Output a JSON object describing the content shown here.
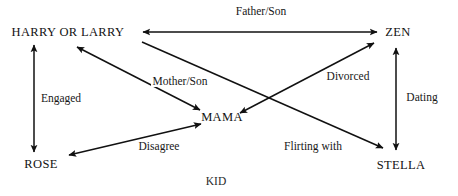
{
  "diagram": {
    "type": "relationship-graph",
    "background": "#ffffff",
    "stroke_color": "#111111",
    "width": 458,
    "height": 196,
    "nodes": [
      {
        "id": "harry",
        "label": "HARRY OR LARRY",
        "x": 68,
        "y": 32
      },
      {
        "id": "zen",
        "label": "ZEN",
        "x": 398,
        "y": 32
      },
      {
        "id": "mama",
        "label": "MAMA",
        "x": 222,
        "y": 117
      },
      {
        "id": "rose",
        "label": "ROSE",
        "x": 41,
        "y": 164
      },
      {
        "id": "stella",
        "label": "STELLA",
        "x": 401,
        "y": 165
      }
    ],
    "edges": [
      {
        "id": "father-son",
        "label": "Father/Son",
        "from": "harry",
        "to": "zen",
        "arrows": "both",
        "x1": 143,
        "y1": 32,
        "x2": 377,
        "y2": 32,
        "label_x": 261,
        "label_y": 11
      },
      {
        "id": "engaged",
        "label": "Engaged",
        "from": "harry",
        "to": "rose",
        "arrows": "both",
        "x1": 34,
        "y1": 45,
        "x2": 34,
        "y2": 152,
        "label_x": 61,
        "label_y": 98
      },
      {
        "id": "dating",
        "label": "Dating",
        "from": "zen",
        "to": "stella",
        "arrows": "both",
        "x1": 396,
        "y1": 48,
        "x2": 396,
        "y2": 150,
        "label_x": 422,
        "label_y": 97
      },
      {
        "id": "mother-son",
        "label": "Mother/Son",
        "from": "harry",
        "to": "mama",
        "arrows": "both",
        "x1": 77,
        "y1": 47,
        "x2": 200,
        "y2": 110,
        "label_x": 180,
        "label_y": 81
      },
      {
        "id": "disagree",
        "label": "Disagree",
        "from": "rose",
        "to": "mama",
        "arrows": "both",
        "x1": 69,
        "y1": 155,
        "x2": 201,
        "y2": 124,
        "label_x": 159,
        "label_y": 146
      },
      {
        "id": "divorced",
        "label": "Divorced",
        "from": "zen",
        "to": "mama",
        "arrows": "both",
        "x1": 374,
        "y1": 43,
        "x2": 240,
        "y2": 113,
        "label_x": 348,
        "label_y": 76
      },
      {
        "id": "flirting-with",
        "label": "Flirting with",
        "from": "harry",
        "to": "stella",
        "arrows": "to",
        "x1": 142,
        "y1": 42,
        "x2": 383,
        "y2": 148,
        "label_x": 313,
        "label_y": 146
      }
    ],
    "caption": {
      "text": "KID",
      "x": 216,
      "y": 181
    }
  }
}
